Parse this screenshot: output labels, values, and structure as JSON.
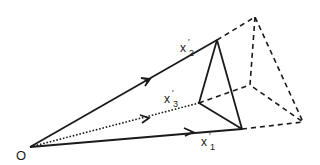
{
  "diagram": {
    "origin": {
      "label": "O",
      "x": 30,
      "y": 147
    },
    "vectors": [
      {
        "id": "x1",
        "label": "x",
        "sup": "′",
        "sub": "1",
        "tip": [
          242,
          129
        ],
        "style": "solid",
        "arrow_at": [
          192,
          132
        ],
        "label_pos": [
          200,
          143
        ]
      },
      {
        "id": "x2",
        "label": "x",
        "sup": "′",
        "sub": "2",
        "tip": [
          217,
          40
        ],
        "style": "solid",
        "arrow_at": [
          148,
          80
        ],
        "label_pos": [
          180,
          50
        ]
      },
      {
        "id": "x3",
        "label": "x",
        "sup": "′",
        "sub": "3",
        "tip": [
          199,
          103
        ],
        "style": "dotted",
        "arrow_at": [
          148,
          119
        ],
        "label_pos": [
          164,
          101
        ]
      }
    ],
    "inner_triangle": [
      [
        217,
        40
      ],
      [
        199,
        103
      ],
      [
        242,
        129
      ]
    ],
    "outer_triangle": [
      [
        255,
        17
      ],
      [
        250,
        85
      ],
      [
        303,
        122
      ]
    ],
    "extension_style": "dashed",
    "colors": {
      "stroke": "#1a1a1a",
      "background": "#ffffff"
    }
  }
}
